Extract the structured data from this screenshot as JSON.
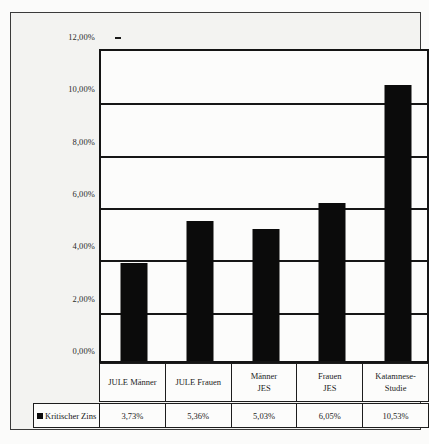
{
  "chart_data": {
    "type": "bar",
    "title": "",
    "xlabel": "",
    "ylabel": "",
    "categories": [
      "JULE Männer",
      "JULE Frauen",
      "Männer JES",
      "Frauen JES",
      "Katamnese-Studie"
    ],
    "category_lines": [
      [
        "JULE Männer"
      ],
      [
        "JULE Frauen"
      ],
      [
        "Männer",
        "JES"
      ],
      [
        "Frauen",
        "JES"
      ],
      [
        "Katamnese-",
        "Studie"
      ]
    ],
    "series": [
      {
        "name": "Kritischer Zins",
        "values": [
          3.73,
          5.36,
          5.03,
          6.05,
          10.53
        ],
        "value_labels": [
          "3,73%",
          "5,36%",
          "5,03%",
          "6,05%",
          "10,53%"
        ],
        "color": "#0b0b0b"
      }
    ],
    "ylim": [
      0,
      12
    ],
    "ytick_values": [
      12,
      10,
      8,
      6,
      4,
      2,
      0
    ],
    "ytick_labels": [
      "12,00%",
      "10,00%",
      "8,00%",
      "6,00%",
      "4,00%",
      "2,00%",
      "0,00%"
    ],
    "grid": true,
    "legend_position": "bottom-left",
    "legend_label": "Kritischer Zins"
  }
}
